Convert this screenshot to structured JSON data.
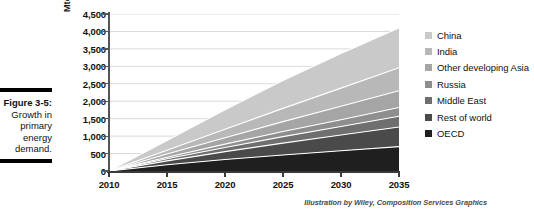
{
  "caption": {
    "figure_label": "Figure 3-5:",
    "description": "Growth in primary energy demand."
  },
  "attribution": "Illustration by Wiley, Composition Services Graphics",
  "legend": {
    "items": [
      {
        "label": "China",
        "color": "#c9c9c9"
      },
      {
        "label": "India",
        "color": "#b8b8b8"
      },
      {
        "label": "Other developing Asia",
        "color": "#a5a5a5"
      },
      {
        "label": "Russia",
        "color": "#8e8e8e"
      },
      {
        "label": "Middle East",
        "color": "#6f6f6f"
      },
      {
        "label": "Rest of world",
        "color": "#4a4a4a"
      },
      {
        "label": "OECD",
        "color": "#1f1f1f"
      }
    ]
  },
  "chart_data": {
    "type": "area",
    "title": "",
    "xlabel": "",
    "ylabel": "Mtoe",
    "x": [
      2010,
      2015,
      2020,
      2025,
      2030,
      2035
    ],
    "xlim": [
      2010,
      2035
    ],
    "ylim": [
      0,
      4500
    ],
    "ytick_labels": [
      "0",
      "500",
      "1,000",
      "1,500",
      "2,000",
      "2,500",
      "3,000",
      "3,500",
      "4,000",
      "4,500"
    ],
    "ytick_values": [
      0,
      500,
      1000,
      1500,
      2000,
      2500,
      3000,
      3500,
      4000,
      4500
    ],
    "xtick_labels": [
      "2010",
      "2015",
      "2020",
      "2025",
      "2030",
      "2035"
    ],
    "grid": true,
    "grid_axis": "y",
    "stacked": true,
    "legend_position": "right",
    "series": [
      {
        "name": "OECD",
        "color": "#1f1f1f",
        "values": [
          0,
          180,
          330,
          460,
          580,
          700
        ]
      },
      {
        "name": "Rest of world",
        "color": "#4a4a4a",
        "values": [
          0,
          110,
          225,
          340,
          450,
          560
        ]
      },
      {
        "name": "Middle East",
        "color": "#6f6f6f",
        "values": [
          0,
          60,
          120,
          185,
          245,
          310
        ]
      },
      {
        "name": "Russia",
        "color": "#8e8e8e",
        "values": [
          0,
          45,
          95,
          145,
          195,
          250
        ]
      },
      {
        "name": "Other developing Asia",
        "color": "#a5a5a5",
        "values": [
          0,
          90,
          185,
          285,
          385,
          480
        ]
      },
      {
        "name": "India",
        "color": "#b8b8b8",
        "values": [
          0,
          110,
          240,
          380,
          520,
          660
        ]
      },
      {
        "name": "China",
        "color": "#c9c9c9",
        "values": [
          0,
          280,
          560,
          800,
          990,
          1140
        ]
      }
    ],
    "stack_totals": [
      0,
      875,
      1755,
      2595,
      3365,
      4100
    ]
  }
}
